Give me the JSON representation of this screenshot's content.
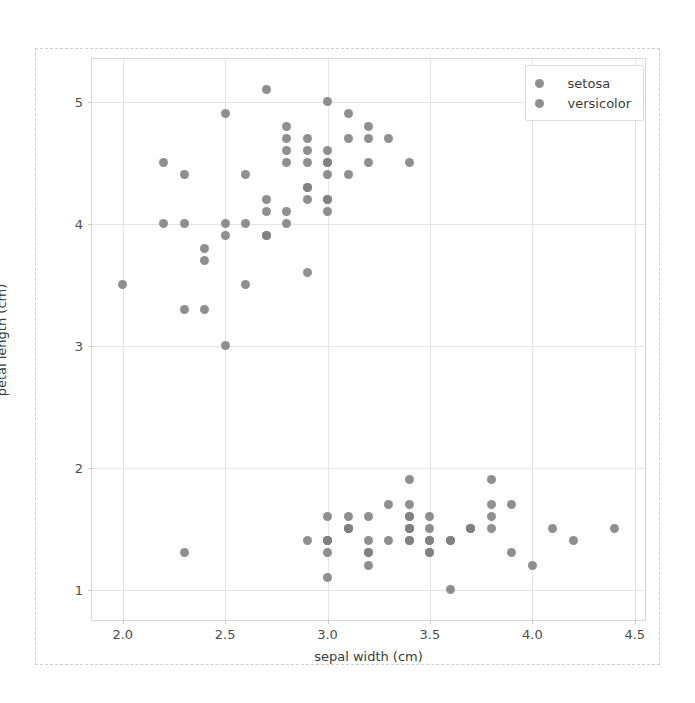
{
  "chart_data": {
    "type": "scatter",
    "title": "",
    "xlabel": "sepal width (cm)",
    "ylabel": "petal length (cm)",
    "xlim": [
      1.85,
      4.55
    ],
    "ylim": [
      0.75,
      5.35
    ],
    "xticks": [
      "2.0",
      "2.5",
      "3.0",
      "3.5",
      "4.0",
      "4.5"
    ],
    "xtick_values": [
      2.0,
      2.5,
      3.0,
      3.5,
      4.0,
      4.5
    ],
    "yticks": [
      "1",
      "2",
      "3",
      "4",
      "5"
    ],
    "ytick_values": [
      1,
      2,
      3,
      4,
      5
    ],
    "grid": true,
    "legend_position": "upper right",
    "marker_color": "#808080",
    "marker_size": 9,
    "series": [
      {
        "name": "setosa",
        "color": "#808080",
        "points": [
          [
            3.5,
            1.4
          ],
          [
            3.0,
            1.4
          ],
          [
            3.2,
            1.3
          ],
          [
            3.1,
            1.5
          ],
          [
            3.6,
            1.4
          ],
          [
            3.9,
            1.7
          ],
          [
            3.4,
            1.4
          ],
          [
            3.4,
            1.5
          ],
          [
            2.9,
            1.4
          ],
          [
            3.1,
            1.5
          ],
          [
            3.7,
            1.5
          ],
          [
            3.4,
            1.6
          ],
          [
            3.0,
            1.4
          ],
          [
            3.0,
            1.1
          ],
          [
            4.0,
            1.2
          ],
          [
            4.4,
            1.5
          ],
          [
            3.9,
            1.3
          ],
          [
            3.5,
            1.4
          ],
          [
            3.8,
            1.7
          ],
          [
            3.8,
            1.5
          ],
          [
            3.4,
            1.7
          ],
          [
            3.7,
            1.5
          ],
          [
            3.6,
            1.0
          ],
          [
            3.3,
            1.7
          ],
          [
            3.4,
            1.9
          ],
          [
            3.0,
            1.6
          ],
          [
            3.4,
            1.6
          ],
          [
            3.5,
            1.5
          ],
          [
            3.4,
            1.4
          ],
          [
            3.2,
            1.6
          ],
          [
            3.1,
            1.6
          ],
          [
            3.4,
            1.5
          ],
          [
            4.1,
            1.5
          ],
          [
            4.2,
            1.4
          ],
          [
            3.1,
            1.5
          ],
          [
            3.2,
            1.2
          ],
          [
            3.5,
            1.3
          ],
          [
            3.6,
            1.4
          ],
          [
            3.0,
            1.3
          ],
          [
            3.4,
            1.5
          ],
          [
            3.5,
            1.3
          ],
          [
            2.3,
            1.3
          ],
          [
            3.2,
            1.3
          ],
          [
            3.5,
            1.6
          ],
          [
            3.8,
            1.9
          ],
          [
            3.0,
            1.4
          ],
          [
            3.8,
            1.6
          ],
          [
            3.2,
            1.4
          ],
          [
            3.7,
            1.5
          ],
          [
            3.3,
            1.4
          ]
        ]
      },
      {
        "name": "versicolor",
        "color": "#808080",
        "points": [
          [
            3.2,
            4.7
          ],
          [
            3.2,
            4.5
          ],
          [
            3.1,
            4.9
          ],
          [
            2.3,
            4.0
          ],
          [
            2.8,
            4.6
          ],
          [
            2.8,
            4.5
          ],
          [
            3.3,
            4.7
          ],
          [
            2.4,
            3.3
          ],
          [
            2.9,
            4.6
          ],
          [
            2.7,
            3.9
          ],
          [
            2.0,
            3.5
          ],
          [
            3.0,
            4.2
          ],
          [
            2.2,
            4.0
          ],
          [
            2.9,
            4.7
          ],
          [
            2.9,
            3.6
          ],
          [
            3.1,
            4.4
          ],
          [
            3.0,
            4.5
          ],
          [
            2.7,
            4.1
          ],
          [
            2.2,
            4.5
          ],
          [
            2.5,
            3.9
          ],
          [
            3.2,
            4.8
          ],
          [
            2.8,
            4.0
          ],
          [
            2.5,
            4.9
          ],
          [
            2.8,
            4.7
          ],
          [
            2.9,
            4.3
          ],
          [
            3.0,
            4.4
          ],
          [
            2.8,
            4.8
          ],
          [
            3.0,
            5.0
          ],
          [
            2.9,
            4.5
          ],
          [
            2.6,
            3.5
          ],
          [
            2.4,
            3.8
          ],
          [
            2.4,
            3.7
          ],
          [
            2.7,
            3.9
          ],
          [
            2.7,
            5.1
          ],
          [
            3.0,
            4.5
          ],
          [
            3.4,
            4.5
          ],
          [
            3.1,
            4.7
          ],
          [
            2.3,
            4.4
          ],
          [
            3.0,
            4.1
          ],
          [
            2.5,
            4.0
          ],
          [
            2.6,
            4.4
          ],
          [
            3.0,
            4.6
          ],
          [
            2.6,
            4.0
          ],
          [
            2.3,
            3.3
          ],
          [
            2.7,
            4.2
          ],
          [
            3.0,
            4.2
          ],
          [
            2.9,
            4.2
          ],
          [
            2.9,
            4.3
          ],
          [
            2.5,
            3.0
          ],
          [
            2.8,
            4.1
          ]
        ]
      }
    ]
  },
  "legend": {
    "entries": [
      {
        "label": "setosa"
      },
      {
        "label": "versicolor"
      }
    ]
  }
}
